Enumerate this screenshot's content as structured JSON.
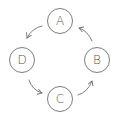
{
  "diagram": {
    "type": "cycle",
    "direction": "counter-clockwise",
    "colors": {
      "stroke": "#6e6e6e",
      "text": "#555555",
      "background": "#ffffff"
    },
    "nodes": [
      {
        "id": "A",
        "label": "A",
        "x": 60,
        "y": 21
      },
      {
        "id": "B",
        "label": "B",
        "x": 97,
        "y": 60
      },
      {
        "id": "C",
        "label": "C",
        "x": 60,
        "y": 99
      },
      {
        "id": "D",
        "label": "D",
        "x": 22,
        "y": 60
      }
    ],
    "edges": [
      {
        "from": "A",
        "to": "D"
      },
      {
        "from": "D",
        "to": "C"
      },
      {
        "from": "C",
        "to": "B"
      },
      {
        "from": "B",
        "to": "A"
      }
    ]
  }
}
